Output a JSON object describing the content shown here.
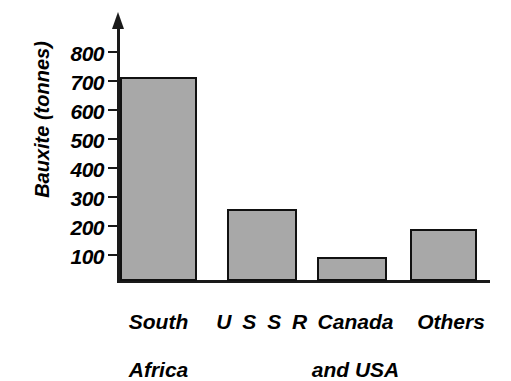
{
  "chart_data": {
    "type": "bar",
    "title": "",
    "xlabel": "",
    "ylabel": "Bauxite (tonnes)",
    "categories": [
      "South Africa",
      "U S S R",
      "Canada and USA",
      "Others"
    ],
    "values": [
      705,
      248,
      83,
      179
    ],
    "ylim": [
      0,
      850
    ],
    "yticks": [
      100,
      200,
      300,
      400,
      500,
      600,
      700,
      800
    ],
    "ytick_labels": [
      "100",
      "200",
      "300",
      "400",
      "500",
      "600",
      "700",
      "800"
    ],
    "grid": false,
    "legend": null,
    "bar_fill_color": "#a8a8a8",
    "bar_border_color": "#111111",
    "axis_color": "#1a1a1a"
  },
  "axis": {
    "y_title": "Bauxite (tonnes)",
    "arrow_icon": "axis-arrow-up-icon"
  },
  "categories": [
    {
      "line1": "South",
      "line2": "Africa",
      "full": "South Africa"
    },
    {
      "line1": "U S S R",
      "line2": "",
      "full": "USSR"
    },
    {
      "line1": "Canada",
      "line2": "and USA",
      "full": "Canada and USA"
    },
    {
      "line1": "Others",
      "line2": "",
      "full": "Others"
    }
  ]
}
